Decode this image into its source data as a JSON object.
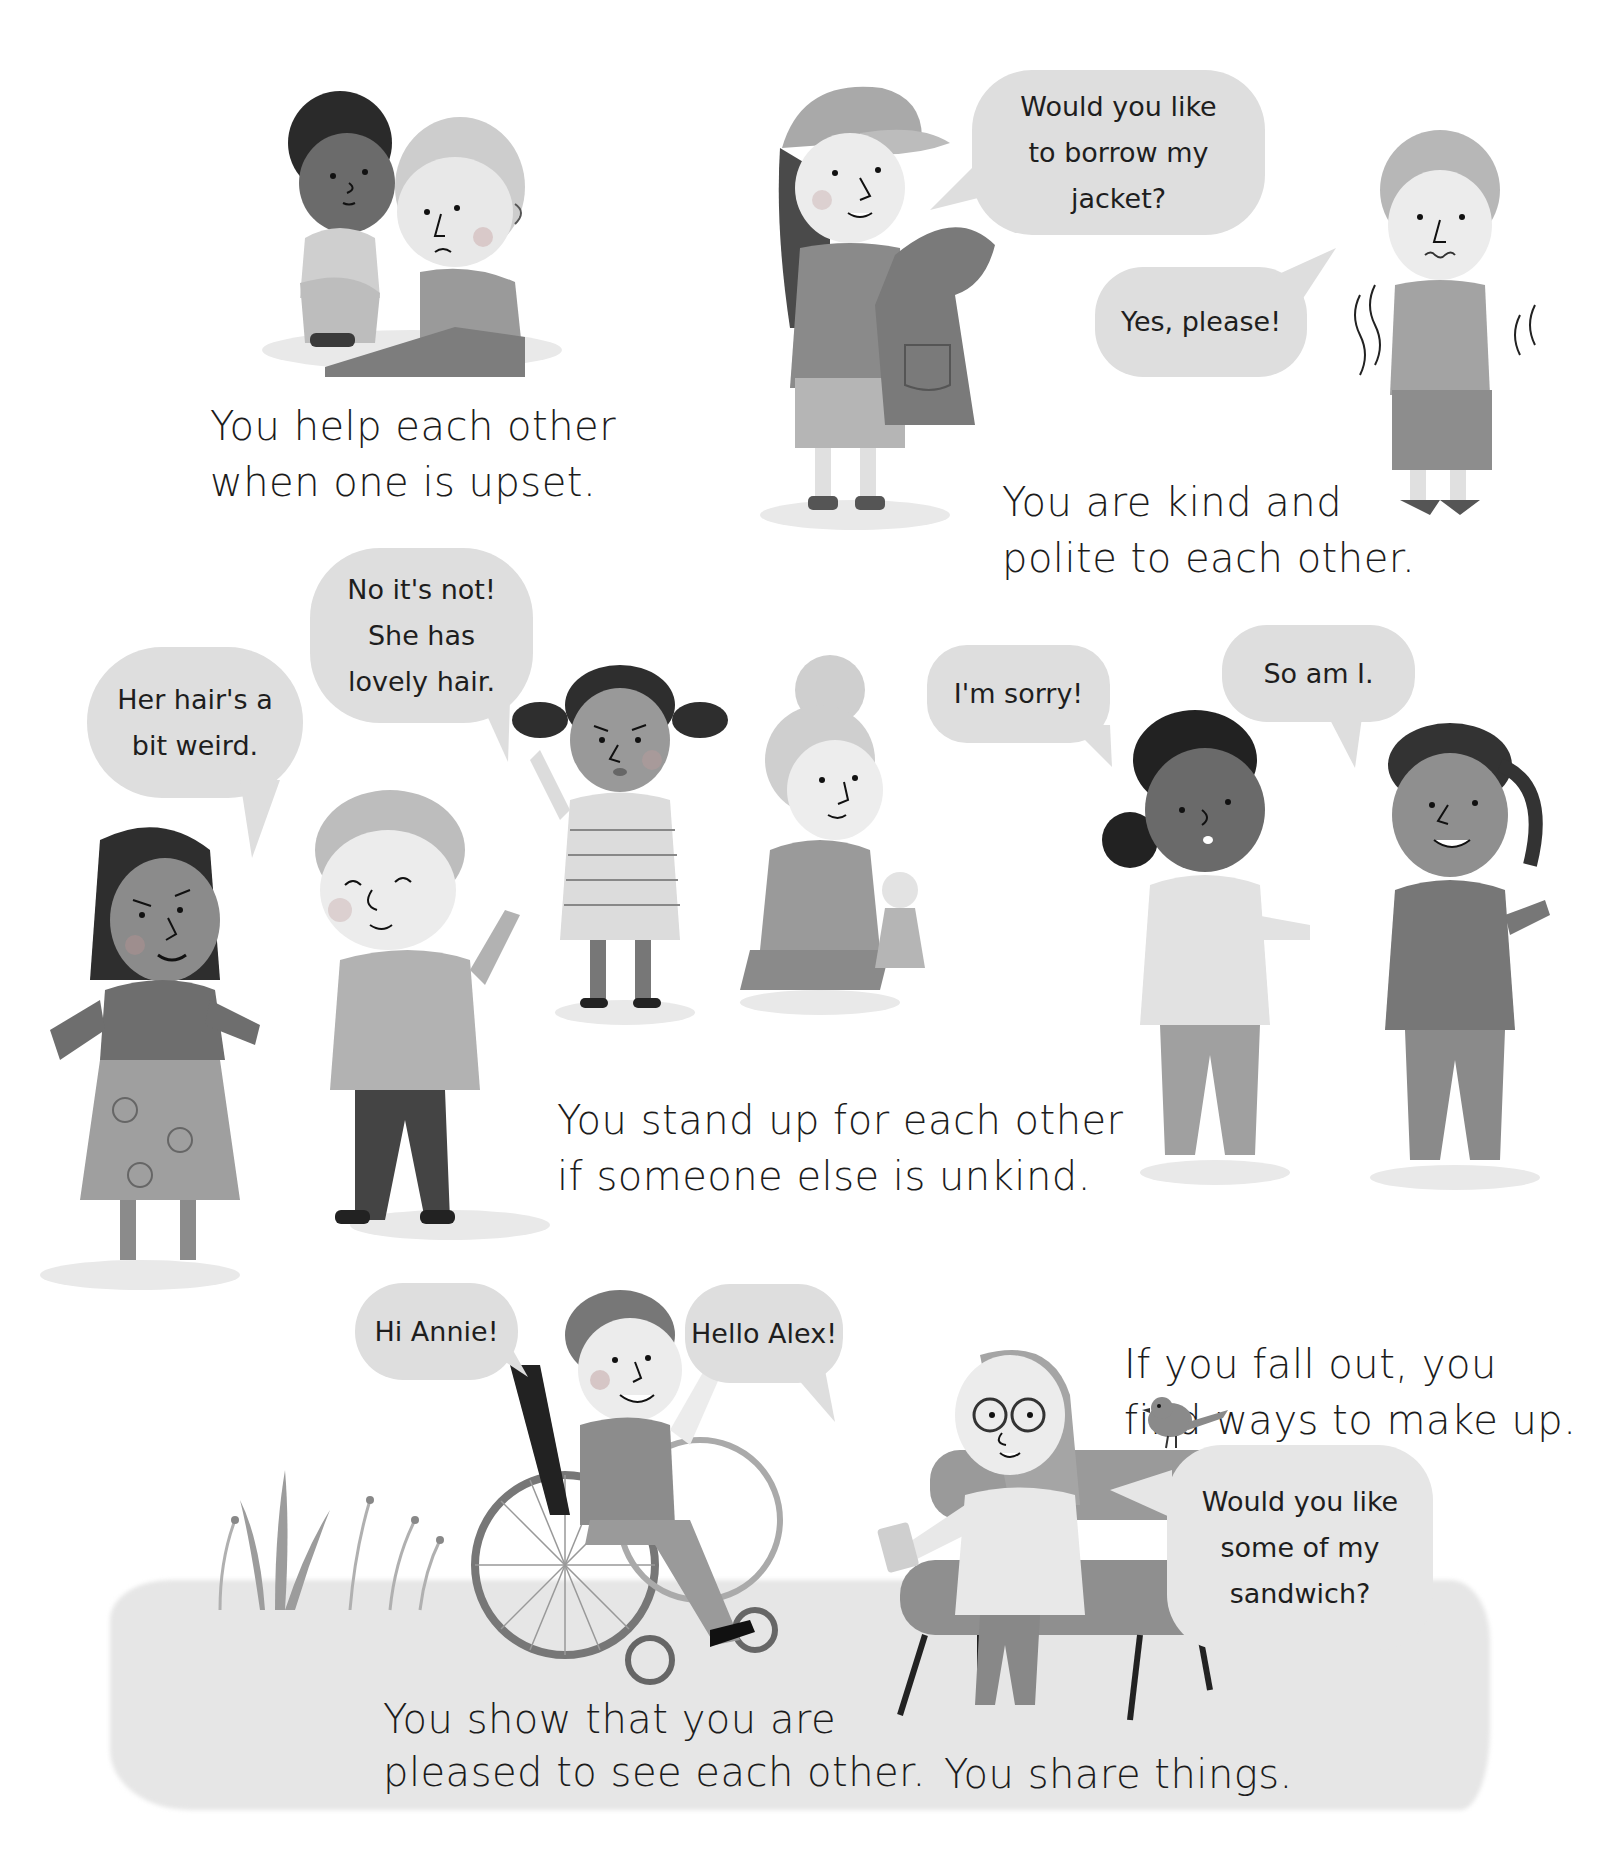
{
  "page": {
    "background": "#ffffff",
    "bubble_color": "#dedede",
    "text_color": "#1c1c1c"
  },
  "scenes": [
    {
      "id": "help",
      "caption": [
        "You help each other",
        "when one is upset."
      ],
      "figures": [
        "comforting-boy",
        "upset-boy"
      ]
    },
    {
      "id": "kind",
      "caption": [
        "You are kind and",
        "polite to each other."
      ],
      "bubbles": [
        {
          "lines": [
            "Would you like",
            "to borrow my",
            "jacket?"
          ]
        },
        {
          "lines": [
            "Yes, please!"
          ]
        }
      ],
      "figures": [
        "girl-with-cap-holding-jacket",
        "shivering-boy"
      ]
    },
    {
      "id": "stand-up",
      "caption": [
        "You stand up for each other",
        "if someone else is unkind."
      ],
      "bubbles": [
        {
          "lines": [
            "Her hair's a",
            "bit weird."
          ]
        },
        {
          "lines": [
            "No it's not!",
            "She has",
            "lovely hair."
          ]
        }
      ],
      "figures": [
        "mean-girl",
        "laughing-boy",
        "defending-girl",
        "kneeling-girl-with-doll"
      ]
    },
    {
      "id": "make-up",
      "caption": [
        "If you fall out, you",
        "find ways to make up."
      ],
      "bubbles": [
        {
          "lines": [
            "I'm sorry!"
          ]
        },
        {
          "lines": [
            "So am I."
          ]
        }
      ],
      "figures": [
        "apologising-girl",
        "ponytail-girl"
      ]
    },
    {
      "id": "pleased",
      "caption": [
        "You show that you are",
        "pleased to see each other."
      ],
      "bubbles": [
        {
          "lines": [
            "Hi Annie!"
          ]
        }
      ],
      "figures": [
        "boy-in-wheelchair",
        "plants"
      ]
    },
    {
      "id": "share",
      "caption": [
        "You share things."
      ],
      "bubbles": [
        {
          "lines": [
            "Hello Alex!"
          ]
        },
        {
          "lines": [
            "Would you like",
            "some of my",
            "sandwich?"
          ]
        }
      ],
      "figures": [
        "girl-on-bench-with-glasses",
        "bird",
        "bench"
      ]
    }
  ]
}
